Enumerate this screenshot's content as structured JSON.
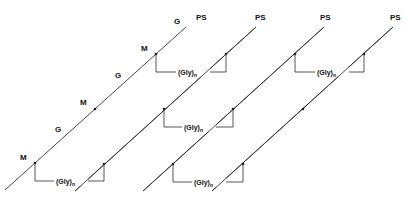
{
  "diagram": {
    "type": "schematic",
    "colors": {
      "line": "#333333",
      "text": "#111111",
      "background": "#ffffff"
    },
    "strand_end_label": "PS",
    "spacer_label": "(Gly)",
    "spacer_subscript": "n",
    "strands": [
      {
        "id": "strand-1",
        "end_label": "PS",
        "site_labels": [
          {
            "text": "M"
          },
          {
            "text": "G"
          },
          {
            "text": "M"
          },
          {
            "text": "G"
          },
          {
            "text": "M"
          },
          {
            "text": "G"
          }
        ]
      },
      {
        "id": "strand-2",
        "end_label": "PS"
      },
      {
        "id": "strand-3",
        "end_label": "PS"
      },
      {
        "id": "strand-4",
        "end_label": "PS"
      }
    ],
    "labels": {
      "ps1": "PS",
      "ps2": "PS",
      "ps3": "PS",
      "ps4": "PS",
      "m1": "M",
      "m2": "M",
      "m3": "M",
      "g1": "G",
      "g2": "G",
      "g3": "G",
      "gly": "(Gly)",
      "n": "n"
    }
  }
}
